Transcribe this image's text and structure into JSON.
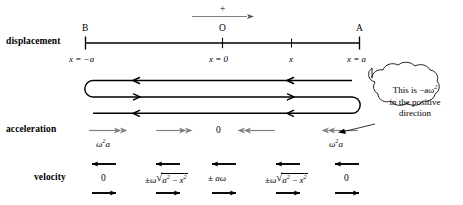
{
  "figure": {
    "background": "#ffffff",
    "ink": "#000000",
    "accel_arrow_color": "#808080",
    "positive_arrow_color": "#707070"
  },
  "rows": {
    "displacement_label": "displacement",
    "acceleration_label": "acceleration",
    "velocity_label": "velocity"
  },
  "positive_direction": {
    "sign": "+"
  },
  "axis": {
    "points": [
      {
        "name": "B",
        "letter": "B",
        "value": "x = −a"
      },
      {
        "name": "O",
        "letter": "O",
        "value": "x = 0"
      },
      {
        "name": "x",
        "letter": "",
        "value": "x"
      },
      {
        "name": "A",
        "letter": "A",
        "value": "x = a"
      }
    ]
  },
  "acceleration": {
    "values": [
      {
        "magnitude": "ω",
        "exp": "2",
        "var": "a",
        "direction": "right"
      },
      {
        "magnitude": "",
        "exp": "",
        "var": "",
        "direction": "right"
      },
      {
        "magnitude": "0",
        "exp": "",
        "var": "",
        "direction": "none"
      },
      {
        "magnitude": "",
        "exp": "",
        "var": "",
        "direction": "left"
      },
      {
        "magnitude": "ω",
        "exp": "2",
        "var": "a",
        "direction": "left"
      }
    ],
    "zero_label": "0",
    "left_label": "ω²a",
    "right_label": "ω²a"
  },
  "velocity": {
    "values": [
      {
        "text": "0",
        "kind": "zero"
      },
      {
        "text": "± ω√(a² − x²)",
        "kind": "sqrt"
      },
      {
        "text": "± aω",
        "kind": "plain"
      },
      {
        "text": "± ω√(a² − x²)",
        "kind": "sqrt"
      },
      {
        "text": "0",
        "kind": "zero"
      }
    ],
    "zero_label": "0",
    "amplitude_label": "± aω",
    "pm": "±",
    "omega": "ω",
    "radicand_a": "a",
    "radicand_x": "x",
    "minus": "−",
    "sq": "2"
  },
  "callout": {
    "line1": "This is −aω",
    "line1_sup": "2",
    "line2": "in the positive",
    "line3": "direction"
  }
}
